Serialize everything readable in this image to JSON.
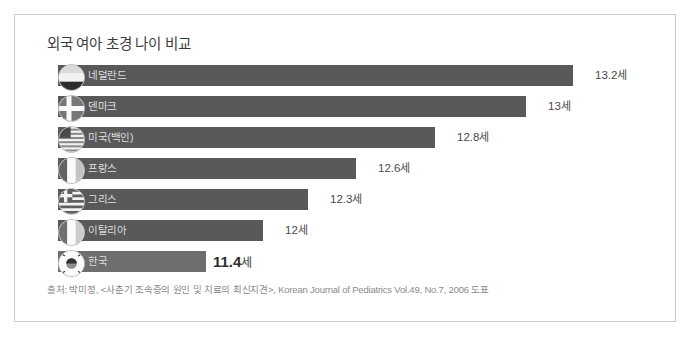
{
  "chart_data": {
    "type": "bar",
    "orientation": "horizontal",
    "title": "외국 여아 초경 나이 비교",
    "xlabel": "",
    "ylabel": "",
    "unit": "세",
    "xlim": [
      0,
      13.2
    ],
    "grid": false,
    "legend": "none",
    "categories": [
      "네덜란드",
      "덴마크",
      "미국(백인)",
      "프랑스",
      "그리스",
      "이탈리아",
      "한국"
    ],
    "values": [
      13.2,
      13,
      12.8,
      12.6,
      12.3,
      12,
      11.4
    ],
    "value_labels": [
      "13.2세",
      "13세",
      "12.8세",
      "12.6세",
      "12.3세",
      "12세",
      "11.4세"
    ],
    "highlight_index": 6,
    "source": "출처: 박미정, <사춘기 조속증의 원인 및 치료의 최신지견>, Korean Journal of Pediatrics Vol.49, No.7, 2006 도표"
  },
  "rows": [
    {
      "label": "네덜란드",
      "num": "13.2",
      "unit": "세",
      "flag": "flag-netherlands-icon",
      "bar_px": 515,
      "value_x": 580
    },
    {
      "label": "덴마크",
      "num": "13",
      "unit": "세",
      "flag": "flag-denmark-icon",
      "bar_px": 468,
      "value_x": 533
    },
    {
      "label": "미국(백인)",
      "num": "12.8",
      "unit": "세",
      "flag": "flag-usa-icon",
      "bar_px": 377,
      "value_x": 442
    },
    {
      "label": "프랑스",
      "num": "12.6",
      "unit": "세",
      "flag": "flag-france-icon",
      "bar_px": 298,
      "value_x": 363
    },
    {
      "label": "그리스",
      "num": "12.3",
      "unit": "세",
      "flag": "flag-greece-icon",
      "bar_px": 250,
      "value_x": 315
    },
    {
      "label": "이탈리아",
      "num": "12",
      "unit": "세",
      "flag": "flag-italy-icon",
      "bar_px": 205,
      "value_x": 270
    },
    {
      "label": "한국",
      "num": "11.4",
      "unit": "세",
      "flag": "flag-korea-icon",
      "bar_px": 148,
      "value_x": 198
    }
  ],
  "colors": {
    "bar": "#595959",
    "bar_highlight": "#6e6e6e",
    "bar_label_text": "#dedede",
    "value_text": "#4a4a4a",
    "title_text": "#3b3b3b",
    "source_text": "#8a8a8a",
    "frame_border": "#c9c9c9",
    "background": "#ffffff"
  }
}
